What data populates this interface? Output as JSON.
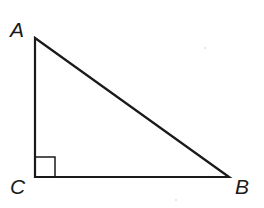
{
  "diagram": {
    "type": "right-triangle",
    "vertices": [
      {
        "id": "A",
        "label": "A",
        "x": 35,
        "y": 38
      },
      {
        "id": "B",
        "label": "B",
        "x": 229,
        "y": 177
      },
      {
        "id": "C",
        "label": "C",
        "x": 35,
        "y": 177
      }
    ],
    "sides": [
      {
        "from": "A",
        "to": "C"
      },
      {
        "from": "C",
        "to": "B"
      },
      {
        "from": "A",
        "to": "B"
      }
    ],
    "right_angle_at": "C",
    "colors": {
      "stroke": "#1a1a1a",
      "background": "#ffffff"
    }
  }
}
